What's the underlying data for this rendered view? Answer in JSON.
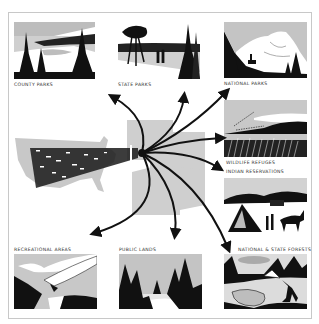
{
  "figure": {
    "theme": "Outdoor recreation destinations reached from across the United States",
    "destinations": [
      {
        "id": "county-parks",
        "label": "COUNTY PARKS"
      },
      {
        "id": "state-parks",
        "label": "STATE PARKS"
      },
      {
        "id": "national-parks",
        "label": "NATIONAL PARKS"
      },
      {
        "id": "wildlife-refuges",
        "label": "WILDLIFE REFUGES"
      },
      {
        "id": "indian-reservations",
        "label": "INDIAN RESERVATIONS"
      },
      {
        "id": "recreational-areas",
        "label": "RECREATIONAL AREAS"
      },
      {
        "id": "public-lands",
        "label": "PUBLIC LANDS"
      },
      {
        "id": "national-state-forests",
        "label": "NATIONAL & STATE FORESTS"
      }
    ],
    "center": {
      "map": "united-states-map",
      "traffic": "cars-converging-stream",
      "arrow_count": 8
    },
    "colors": {
      "ink": "#111111",
      "gray": "#bdbdbd",
      "light_gray": "#d6d6d6",
      "border": "#c8c8c8",
      "background": "#ffffff"
    }
  }
}
